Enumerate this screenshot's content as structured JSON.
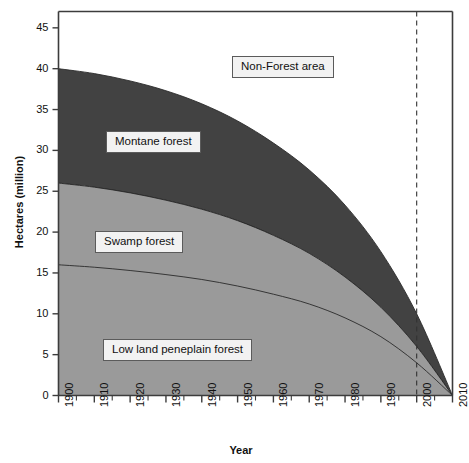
{
  "chart_data": {
    "type": "area",
    "title": "",
    "xlabel": "Year",
    "ylabel": "Hectares (million)",
    "xlim": [
      1900,
      2010
    ],
    "ylim": [
      0,
      47
    ],
    "grid": false,
    "legend_position": "in-plot-callouts",
    "stacked": true,
    "y_ticks": [
      0,
      5,
      10,
      15,
      20,
      25,
      30,
      35,
      40,
      45
    ],
    "x_ticks": [
      1900,
      1910,
      1920,
      1930,
      1940,
      1950,
      1960,
      1970,
      1980,
      1990,
      2000,
      2010
    ],
    "x_minor_tick_step": 5,
    "annotations": [
      {
        "label": "Non-Forest area",
        "x": 1957,
        "y": 43
      },
      {
        "label": "Montane forest",
        "x": 1930,
        "y": 31.5
      },
      {
        "label": "Swamp forest",
        "x": 1923,
        "y": 20.5
      },
      {
        "label": "Low land peneplain forest",
        "x": 1932,
        "y": 7
      }
    ],
    "reference_lines": [
      {
        "x": 2000,
        "style": "dashed",
        "color": "#333333"
      }
    ],
    "x": [
      1900,
      1910,
      1920,
      1930,
      1940,
      1950,
      1960,
      1970,
      1980,
      1990,
      2000,
      2010
    ],
    "series": [
      {
        "name": "Low land peneplain forest",
        "color": "#9a9a9a",
        "values": [
          16.0,
          15.7,
          15.3,
          14.8,
          14.2,
          13.4,
          12.4,
          11.2,
          9.5,
          7.2,
          4.0,
          0.0
        ]
      },
      {
        "name": "Swamp forest",
        "color": "#9a9a9a",
        "values": [
          10.0,
          9.8,
          9.5,
          9.1,
          8.6,
          8.0,
          7.2,
          6.2,
          5.0,
          3.6,
          2.0,
          0.0
        ]
      },
      {
        "name": "Montane forest",
        "color": "#424242",
        "values": [
          14.0,
          13.9,
          13.7,
          13.4,
          12.9,
          12.2,
          11.3,
          10.2,
          8.8,
          6.8,
          4.0,
          0.0
        ]
      }
    ],
    "cumulative_totals": {
      "low_land_peneplain_forest": [
        16.0,
        15.7,
        15.3,
        14.8,
        14.2,
        13.4,
        12.4,
        11.2,
        9.5,
        7.2,
        4.0,
        0.0
      ],
      "swamp_forest_top": [
        26.0,
        25.5,
        24.8,
        23.9,
        22.8,
        21.4,
        19.6,
        17.4,
        14.5,
        10.8,
        6.0,
        0.0
      ],
      "montane_forest_top": [
        40.0,
        39.4,
        38.5,
        37.3,
        35.7,
        33.6,
        30.9,
        27.6,
        23.3,
        17.6,
        10.0,
        0.0
      ]
    },
    "colors": {
      "montane": "#424242",
      "swamp": "#9a9a9a",
      "lowland": "#9a9a9a",
      "non_forest": "#ffffff",
      "axis": "#3c3c3c",
      "callout_bg": "#f2f2f2",
      "callout_border": "#5b5b5b"
    }
  },
  "axes": {
    "y_tick_labels": [
      "45",
      "40",
      "35",
      "30",
      "25",
      "20",
      "15",
      "10",
      "5",
      "0"
    ],
    "x_tick_labels": [
      "1900",
      "1910",
      "1920",
      "1930",
      "1940",
      "1950",
      "1960",
      "1970",
      "1980",
      "1990",
      "2000",
      "2010"
    ],
    "y_title": "Hectares (million)",
    "x_title": "Year"
  },
  "callouts": {
    "non_forest": "Non-Forest area",
    "montane": "Montane forest",
    "swamp": "Swamp forest",
    "lowland": "Low land peneplain forest"
  }
}
